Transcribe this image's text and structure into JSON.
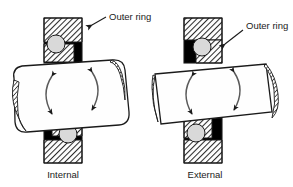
{
  "figure": {
    "background_color": "#ffffff",
    "line_color": "#1a1a1a",
    "hatch_color": "#3a3a3a",
    "solid_fill_color": "#000000",
    "ball_color": "#d9d9d9",
    "block_fill_color": "#fefefe"
  },
  "assemblies": [
    {
      "id": "internal",
      "caption": "Internal",
      "callout_label": "Outer ring",
      "ball_count": 2,
      "contact_side": "right"
    },
    {
      "id": "external",
      "caption": "External",
      "callout_label": "Outer ring",
      "ball_count": 2,
      "contact_side": "left"
    }
  ],
  "rotation_arrows": {
    "count_per_block": 2,
    "direction": "bidirectional-oscillating"
  }
}
